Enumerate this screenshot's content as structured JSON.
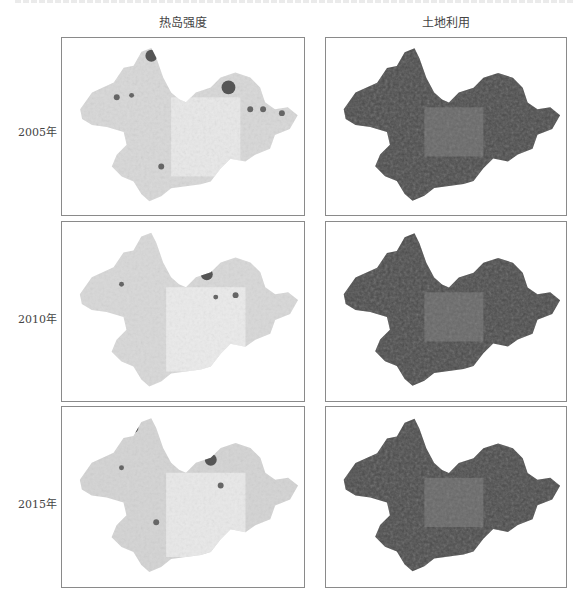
{
  "figure": {
    "columns": [
      {
        "title": "热岛强度"
      },
      {
        "title": "土地利用"
      }
    ],
    "rows": [
      {
        "label": "2005年"
      },
      {
        "label": "2010年"
      },
      {
        "label": "2015年"
      }
    ],
    "colors": {
      "heat_base": "#d6d6d6",
      "heat_light": "#ececec",
      "heat_hot": "#555555",
      "land_base": "#4a4a4a",
      "land_mid": "#8c8c8c",
      "border": "#8a8a8a"
    }
  }
}
